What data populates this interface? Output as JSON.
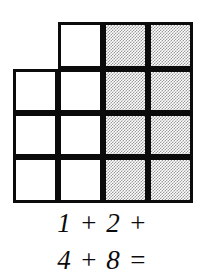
{
  "figure": {
    "name": "shaded-fraction-grid-puzzle",
    "background_color": "#ffffff",
    "line_color": "#0b0b0b",
    "shade_color": "#d0d0d0",
    "shade_style": "dithered-halftone-checkerboard"
  },
  "grid": {
    "columns": 4,
    "rows": 4,
    "cell_size_px": 45,
    "shape_note": "top row omits the leftmost cell (staircase outline)",
    "cells": [
      {
        "row": 1,
        "col": 1,
        "present": false,
        "shaded": false,
        "label": "r1c1"
      },
      {
        "row": 1,
        "col": 2,
        "present": true,
        "shaded": false,
        "label": "r1c2"
      },
      {
        "row": 1,
        "col": 3,
        "present": true,
        "shaded": true,
        "label": "r1c3"
      },
      {
        "row": 1,
        "col": 4,
        "present": true,
        "shaded": true,
        "label": "r1c4"
      },
      {
        "row": 2,
        "col": 1,
        "present": true,
        "shaded": false,
        "label": "r2c1"
      },
      {
        "row": 2,
        "col": 2,
        "present": true,
        "shaded": false,
        "label": "r2c2"
      },
      {
        "row": 2,
        "col": 3,
        "present": true,
        "shaded": true,
        "label": "r2c3"
      },
      {
        "row": 2,
        "col": 4,
        "present": true,
        "shaded": true,
        "label": "r2c4"
      },
      {
        "row": 3,
        "col": 1,
        "present": true,
        "shaded": false,
        "label": "r3c1"
      },
      {
        "row": 3,
        "col": 2,
        "present": true,
        "shaded": false,
        "label": "r3c2"
      },
      {
        "row": 3,
        "col": 3,
        "present": true,
        "shaded": true,
        "label": "r3c3"
      },
      {
        "row": 3,
        "col": 4,
        "present": true,
        "shaded": true,
        "label": "r3c4"
      },
      {
        "row": 4,
        "col": 1,
        "present": true,
        "shaded": false,
        "label": "r4c1"
      },
      {
        "row": 4,
        "col": 2,
        "present": true,
        "shaded": false,
        "label": "r4c2"
      },
      {
        "row": 4,
        "col": 3,
        "present": true,
        "shaded": true,
        "label": "r4c3"
      },
      {
        "row": 4,
        "col": 4,
        "present": true,
        "shaded": true,
        "label": "r4c4"
      }
    ],
    "counts": {
      "total_cells": 15,
      "shaded_cells": 8,
      "unshaded_cells": 7
    }
  },
  "equation": {
    "line1": "1 + 2 +",
    "line2": "4 + 8 =",
    "terms": [
      1,
      2,
      4,
      8
    ],
    "operators": [
      "+",
      "+",
      "+",
      "="
    ],
    "result": ""
  }
}
